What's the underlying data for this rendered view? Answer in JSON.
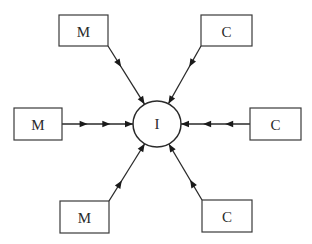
{
  "diagram": {
    "type": "hub-and-spoke",
    "hub": {
      "label": "I",
      "cx": 157,
      "cy": 124,
      "rx": 24,
      "ry": 23
    },
    "nodes": [
      {
        "id": "m-top",
        "label": "M",
        "x": 59,
        "y": 15,
        "w": 49,
        "h": 31,
        "anchor": [
          108,
          46
        ],
        "arrows": 2
      },
      {
        "id": "c-top",
        "label": "C",
        "x": 201,
        "y": 15,
        "w": 51,
        "h": 31,
        "anchor": [
          201,
          46
        ],
        "arrows": 2
      },
      {
        "id": "m-left",
        "label": "M",
        "x": 14,
        "y": 108,
        "w": 48,
        "h": 32,
        "anchor": [
          62,
          124
        ],
        "arrows": 3
      },
      {
        "id": "c-right",
        "label": "C",
        "x": 250,
        "y": 108,
        "w": 51,
        "h": 32,
        "anchor": [
          250,
          124
        ],
        "arrows": 3
      },
      {
        "id": "m-bottom",
        "label": "M",
        "x": 60,
        "y": 201,
        "w": 49,
        "h": 32,
        "anchor": [
          109,
          201
        ],
        "arrows": 2
      },
      {
        "id": "c-bottom",
        "label": "C",
        "x": 202,
        "y": 200,
        "w": 50,
        "h": 32,
        "anchor": [
          202,
          200
        ],
        "arrows": 2
      }
    ],
    "edge_direction": "toward-hub",
    "colors": {
      "stroke": "#2a2a2a",
      "fill": "#ffffff",
      "arrow": "#1a1a1a"
    }
  }
}
